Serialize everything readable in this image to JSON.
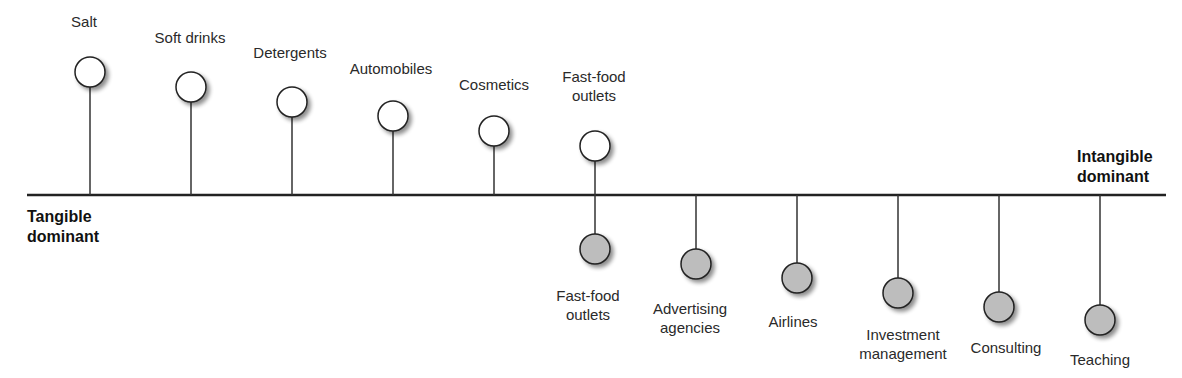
{
  "axis": {
    "left_label": [
      "Tangible",
      "dominant"
    ],
    "right_label": [
      "Intangible",
      "dominant"
    ]
  },
  "colors": {
    "tangible_fill": "#ffffff",
    "intangible_fill": "#bdbdbd",
    "stroke": "#222222"
  },
  "tangible_items": [
    {
      "label": "Salt",
      "x": 90,
      "cy": 72
    },
    {
      "label": "Soft drinks",
      "x": 191,
      "cy": 87
    },
    {
      "label": "Detergents",
      "x": 292,
      "cy": 102
    },
    {
      "label": "Automobiles",
      "x": 393,
      "cy": 116
    },
    {
      "label": "Cosmetics",
      "x": 494,
      "cy": 131
    },
    {
      "label": "Fast-food outlets",
      "x": 595,
      "cy": 146
    }
  ],
  "intangible_items": [
    {
      "label": "Fast-food outlets",
      "x": 595,
      "cy": 249
    },
    {
      "label": "Advertising agencies",
      "x": 696,
      "cy": 264
    },
    {
      "label": "Airlines",
      "x": 797,
      "cy": 278
    },
    {
      "label": "Investment management",
      "x": 898,
      "cy": 293
    },
    {
      "label": "Consulting",
      "x": 999,
      "cy": 307
    },
    {
      "label": "Teaching",
      "x": 1100,
      "cy": 320
    }
  ]
}
